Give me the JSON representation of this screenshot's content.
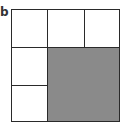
{
  "figure": {
    "label": "b",
    "grid": {
      "rows": 3,
      "cols": 3,
      "cells": [
        {
          "id": "r1c1",
          "row": 1,
          "col": 1,
          "rowspan": 1,
          "colspan": 1,
          "fill": "#ffffff"
        },
        {
          "id": "r1c2",
          "row": 1,
          "col": 2,
          "rowspan": 1,
          "colspan": 1,
          "fill": "#ffffff"
        },
        {
          "id": "r1c3",
          "row": 1,
          "col": 3,
          "rowspan": 1,
          "colspan": 1,
          "fill": "#ffffff"
        },
        {
          "id": "r2c1",
          "row": 2,
          "col": 1,
          "rowspan": 1,
          "colspan": 1,
          "fill": "#ffffff"
        },
        {
          "id": "r3c1",
          "row": 3,
          "col": 1,
          "rowspan": 1,
          "colspan": 1,
          "fill": "#ffffff"
        },
        {
          "id": "shaded-block",
          "row": 2,
          "col": 2,
          "rowspan": 2,
          "colspan": 2,
          "fill": "#8a8a8a"
        }
      ]
    },
    "colors": {
      "border": "#2a2a2a",
      "shaded": "#8a8a8a",
      "empty": "#ffffff"
    }
  }
}
